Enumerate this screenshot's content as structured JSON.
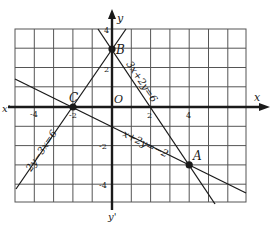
{
  "figure": {
    "axes": {
      "x_label": "x",
      "x_neg_label": "x'",
      "y_label": "y",
      "y_neg_label": "y'",
      "origin_label": "O",
      "x_ticks": [
        "-4",
        "-2",
        "2",
        "4"
      ],
      "y_ticks": [
        "4",
        "2",
        "-2",
        "-4"
      ],
      "x_range": [
        -5,
        7
      ],
      "y_range": [
        -5,
        4
      ],
      "grid": true
    },
    "lines": [
      {
        "equation": "3x + 2y = 6",
        "label": "3x+2y=6"
      },
      {
        "equation": "x + 2y = -2",
        "label": "x+2y=−2"
      },
      {
        "equation": "2y - 3x = 6",
        "label": "2y−3x=6"
      }
    ],
    "points": [
      {
        "name": "A",
        "x": 4,
        "y": -3
      },
      {
        "name": "B",
        "x": 0,
        "y": 3
      },
      {
        "name": "C",
        "x": -2,
        "y": 0
      }
    ],
    "colors": {
      "ink": "#1a1a1a",
      "grid": "#555555",
      "paper": "#ffffff"
    }
  }
}
